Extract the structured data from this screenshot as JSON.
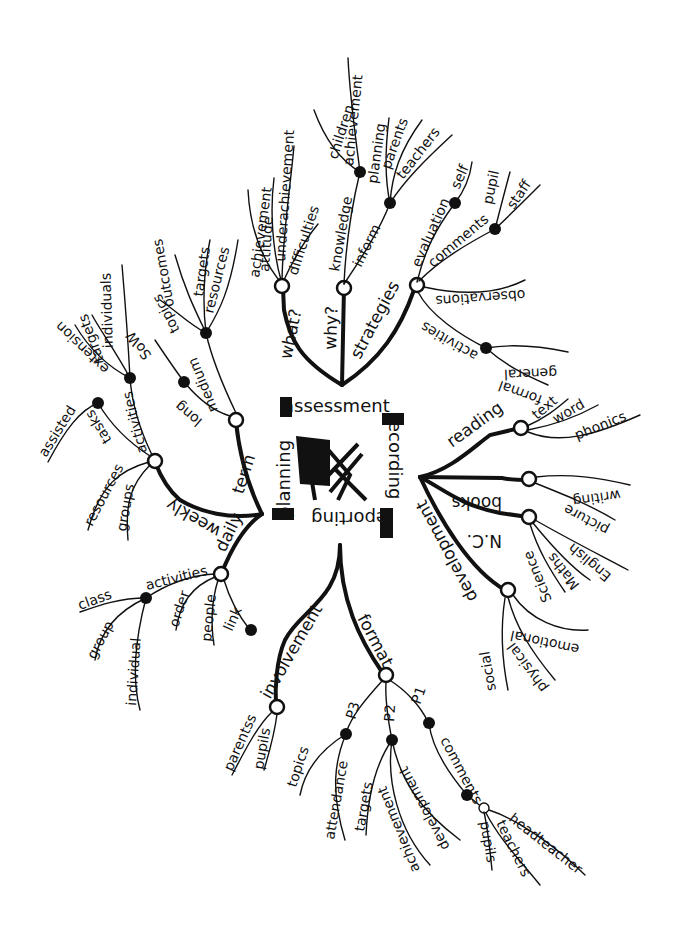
{
  "center": {
    "labels": {
      "assessment": "assessment",
      "recording": "recording",
      "reporting": "reporting",
      "planning": "planning"
    },
    "icon": "scribble-drawing-icon"
  },
  "assessment": {
    "label": "assessment",
    "what": {
      "label": "what?",
      "children": [
        "achievement",
        "attitude",
        "underachievement",
        "difficulties"
      ]
    },
    "why": {
      "label": "why?",
      "knowledge": {
        "label": "knowledge",
        "children": [
          "children",
          "achievement"
        ]
      },
      "inform": {
        "label": "inform",
        "children": [
          "planning",
          "parents",
          "teachers"
        ]
      }
    },
    "strategies": {
      "label": "strategies",
      "evaluation": {
        "label": "evaluation",
        "children": [
          "self"
        ]
      },
      "comments": {
        "label": "comments",
        "children": [
          "pupil",
          "staff"
        ]
      },
      "observations": {
        "label": "observations"
      },
      "activities": {
        "label": "activities",
        "children": [
          "general",
          "formal"
        ]
      }
    }
  },
  "recording": {
    "label": "recording",
    "reading": {
      "label": "reading",
      "children": [
        "text",
        "word",
        "phonics"
      ]
    },
    "books": {
      "label": "books",
      "children": [
        "writing",
        "picture"
      ]
    },
    "nc": {
      "label": "N.C.",
      "children": [
        "English",
        "Maths",
        "Science"
      ]
    },
    "development": {
      "label": "development",
      "children": [
        "emotional",
        "physical",
        "social"
      ]
    }
  },
  "reporting": {
    "label": "reporting",
    "involvement": {
      "label": "involvement",
      "children": [
        "parentss",
        "pupils"
      ]
    },
    "format": {
      "label": "format",
      "p3": {
        "label": "P3",
        "children": [
          "topics",
          "attendance"
        ]
      },
      "p2": {
        "label": "P2",
        "children": [
          "targets",
          "achievement",
          "development"
        ]
      },
      "p1": {
        "label": "P1",
        "comments": {
          "label": "comments",
          "children": [
            "pupils",
            "teachers",
            "headteacher"
          ]
        }
      }
    }
  },
  "planning": {
    "label": "planning",
    "term": {
      "label": "term",
      "long": {
        "label": "long",
        "children": [
          "SoW"
        ]
      },
      "medium": {
        "label": "medium",
        "children": [
          "topics",
          "outcomes",
          "targets",
          "resources"
        ]
      }
    },
    "weekly": {
      "label": "weekly",
      "activities": {
        "label": "activities",
        "children": [
          "extension",
          "targets",
          "individuals"
        ]
      },
      "tasks": {
        "label": "tasks",
        "children": [
          "assisted"
        ]
      },
      "resources": {
        "label": "resources"
      },
      "groups": {
        "label": "groups"
      }
    },
    "daily": {
      "label": "daily",
      "activities": {
        "label": "activities",
        "children": [
          "class",
          "group",
          "individual"
        ]
      },
      "order": {
        "label": "order"
      },
      "people": {
        "label": "people"
      },
      "link": {
        "label": "link"
      }
    }
  }
}
